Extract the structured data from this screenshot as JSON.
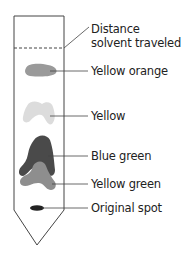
{
  "diagram": {
    "labels": {
      "solvent_front_line1": "Distance",
      "solvent_front_line2": "solvent traveled",
      "yellow_orange": "Yellow orange",
      "yellow": "Yellow",
      "blue_green": "Blue green",
      "yellow_green": "Yellow green",
      "original_spot": "Original spot"
    },
    "colors": {
      "outline": "#444444",
      "yellow_orange_spot": "#9a9a9a",
      "yellow_spot": "#dcdcdc",
      "blue_green_spot": "#4a4a4a",
      "yellow_green_spot": "#8e8e8e",
      "original_spot": "#222222"
    }
  }
}
